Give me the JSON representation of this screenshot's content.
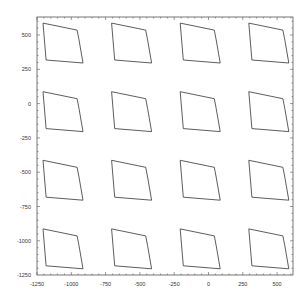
{
  "chart_data": {
    "type": "line",
    "title": "",
    "xlabel": "",
    "ylabel": "",
    "xlim": [
      -1250,
      625
    ],
    "ylim": [
      -1250,
      625
    ],
    "grid": false,
    "legend": null,
    "x_ticks": [
      -1250,
      -1000,
      -750,
      -500,
      -250,
      0,
      250,
      500
    ],
    "y_ticks": [
      500,
      250,
      0,
      -250,
      -500,
      -750,
      -1000,
      -1250
    ],
    "x_tick_labels": [
      "-1250",
      "-1000",
      "-750",
      "-500",
      "-250",
      "0",
      "250",
      "500"
    ],
    "y_tick_labels": [
      "500",
      "250",
      "0",
      "-250",
      "-500",
      "-750",
      "-1000",
      "-1250"
    ],
    "base_shape": {
      "points": [
        [
          -1206,
          587
        ],
        [
          -958,
          536
        ],
        [
          -944,
          464
        ],
        [
          -915,
          296
        ],
        [
          -1184,
          318
        ],
        [
          -1206,
          587
        ]
      ]
    },
    "grid_layout": {
      "columns": 4,
      "rows": 4,
      "column_offsets": [
        0,
        500,
        1000,
        1500
      ],
      "row_offsets": [
        0,
        -500,
        -1000,
        -1500
      ]
    },
    "series_color": "#333333"
  },
  "axes": {
    "frame_color": "#555555",
    "label_color": "#333333"
  }
}
